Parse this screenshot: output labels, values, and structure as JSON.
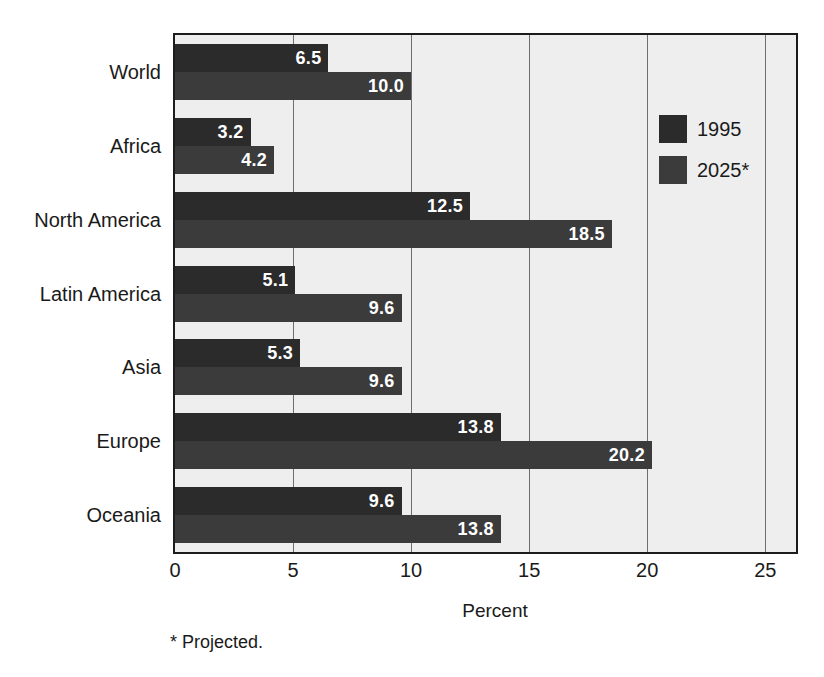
{
  "chart_data": {
    "type": "bar",
    "orientation": "horizontal",
    "title": "",
    "xlabel": "Percent",
    "ylabel": "",
    "xlim": [
      0,
      26.3
    ],
    "xticks": [
      0,
      5,
      10,
      15,
      20,
      25
    ],
    "xticklabels": [
      "0",
      "5",
      "10",
      "15",
      "20",
      "25"
    ],
    "grid": "vertical",
    "categories": [
      "World",
      "Africa",
      "North America",
      "Latin America",
      "Asia",
      "Europe",
      "Oceania"
    ],
    "series": [
      {
        "name": "1995",
        "color": "#2b2b2b",
        "values": [
          6.5,
          3.2,
          12.5,
          5.1,
          5.3,
          13.8,
          9.6
        ],
        "labels": [
          "6.5",
          "3.2",
          "12.5",
          "5.1",
          "5.3",
          "13.8",
          "9.6"
        ]
      },
      {
        "name": "2025*",
        "color": "#3b3b3b",
        "values": [
          10.0,
          4.2,
          18.5,
          9.6,
          9.6,
          20.2,
          13.8
        ],
        "labels": [
          "10.0",
          "4.2",
          "18.5",
          "9.6",
          "9.6",
          "20.2",
          "13.8"
        ]
      }
    ],
    "legend": {
      "position": "inside-right",
      "entries": [
        {
          "label": "1995",
          "color": "#2b2b2b"
        },
        {
          "label": "2025*",
          "color": "#3b3b3b"
        }
      ]
    },
    "annotations": [
      {
        "text": "* Projected."
      }
    ],
    "colors": {
      "plot_background": "#eeeeee",
      "page_background": "#ffffff",
      "axis": "#1c1c1c",
      "gridline": "#6e6e6e",
      "value_label": "#ffffff",
      "text": "#1a1a1a"
    }
  },
  "footnote": "* Projected."
}
